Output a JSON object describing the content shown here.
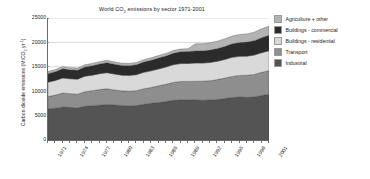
{
  "chart_data": {
    "type": "area",
    "stacked": true,
    "title": "World CO2 emissions by sector 1971-2001",
    "title_parts": {
      "pre": "World CO",
      "sub": "2",
      "post": " emissions by sector 1971-2001"
    },
    "xlabel": "",
    "ylabel": "Carbon dioxide emissions (MtCO2 yr-1)",
    "ylabel_parts": {
      "pre": "Carbon dioxide emissions (MtCO",
      "sub": "2",
      "mid": " yr",
      "sup": "-1",
      "post": ")"
    },
    "x": [
      1971,
      1972,
      1973,
      1974,
      1975,
      1976,
      1977,
      1978,
      1979,
      1980,
      1981,
      1982,
      1983,
      1984,
      1985,
      1986,
      1987,
      1988,
      1989,
      1990,
      1991,
      1992,
      1993,
      1994,
      1995,
      1996,
      1997,
      1998,
      1999,
      2000,
      2001
    ],
    "xticks": [
      "1971",
      "1974",
      "1977",
      "1980",
      "1983",
      "1986",
      "1989",
      "1992",
      "1995",
      "1998",
      "2001"
    ],
    "xtick_indices": [
      0,
      3,
      6,
      9,
      12,
      15,
      18,
      21,
      24,
      27,
      30
    ],
    "yticks": [
      0,
      5000,
      10000,
      15000,
      20000,
      25000
    ],
    "ytick_labels": [
      "0",
      "5000",
      "10000",
      "15000",
      "20000",
      "25000"
    ],
    "ylim": [
      0,
      25000
    ],
    "xlim": [
      1971,
      2001
    ],
    "grid": "horizontal",
    "legend_position": "right",
    "series": [
      {
        "name": "Industrial",
        "color": "#545454",
        "values": [
          6350,
          6520,
          6780,
          6700,
          6560,
          6900,
          7020,
          7120,
          7300,
          7180,
          7050,
          7000,
          7060,
          7340,
          7520,
          7680,
          7880,
          8120,
          8220,
          8180,
          8220,
          8160,
          8200,
          8320,
          8500,
          8700,
          8820,
          8760,
          8820,
          9100,
          9350
        ]
      },
      {
        "name": "Transport",
        "color": "#8e8e8e",
        "values": [
          2550,
          2680,
          2850,
          2800,
          2840,
          2980,
          3080,
          3220,
          3200,
          3080,
          3020,
          3000,
          3050,
          3160,
          3240,
          3420,
          3520,
          3680,
          3780,
          3820,
          3820,
          3900,
          3940,
          4060,
          4180,
          4320,
          4420,
          4500,
          4620,
          4760,
          4850
        ]
      },
      {
        "name": "Buildings - residential",
        "color": "#d9d9d9",
        "values": [
          2950,
          3000,
          3080,
          3040,
          3060,
          3180,
          3180,
          3240,
          3300,
          3260,
          3220,
          3240,
          3280,
          3360,
          3420,
          3460,
          3540,
          3620,
          3660,
          3680,
          3720,
          3700,
          3740,
          3760,
          3820,
          3920,
          3900,
          3920,
          3960,
          4040,
          4100
        ]
      },
      {
        "name": "Buildings - commercial",
        "color": "#2b2b2b",
        "values": [
          1750,
          1800,
          1870,
          1840,
          1830,
          1900,
          1940,
          2000,
          2040,
          2000,
          1980,
          1980,
          2020,
          2100,
          2160,
          2220,
          2280,
          2360,
          2420,
          2440,
          2480,
          2500,
          2540,
          2600,
          2660,
          2760,
          2820,
          2880,
          2960,
          3060,
          3140
        ]
      },
      {
        "name": "Agriculture + other",
        "color": "#b3b3b3",
        "values": [
          420,
          430,
          450,
          450,
          440,
          460,
          470,
          480,
          490,
          480,
          470,
          470,
          480,
          500,
          510,
          520,
          530,
          550,
          560,
          570,
          1460,
          1470,
          1490,
          1520,
          1560,
          1600,
          1640,
          1680,
          1740,
          1820,
          1860
        ]
      }
    ],
    "legend_order": [
      "Agriculture + other",
      "Buildings - commercial",
      "Buildings - residential",
      "Transport",
      "Industrial"
    ],
    "axis_color": "#6a6a6a",
    "grid_color": "#c8c8c8"
  }
}
